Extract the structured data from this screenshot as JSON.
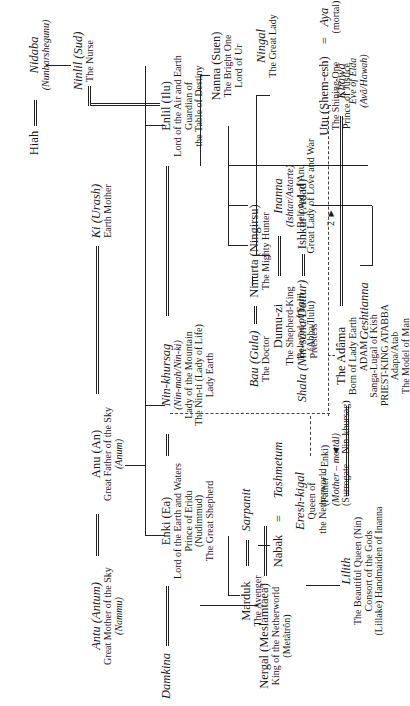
{
  "diagram": {
    "type": "genealogy-tree",
    "orientation": "rotated-90-ccw",
    "nodes": {
      "hiah": {
        "name": "Hiah"
      },
      "nidaba": {
        "name": "Nidaba",
        "alias": "(Nunbarshegunu)"
      },
      "ninlil": {
        "name": "Ninlil (Sud)",
        "title": "The Nurse"
      },
      "ki": {
        "name": "Ki (Urash)",
        "title": "Earth Mother"
      },
      "anu": {
        "name": "Anu (An)",
        "title": "Great Father of the Sky",
        "alias": "(Anum)"
      },
      "antu": {
        "name": "Antu (Antum)",
        "title": "Great Mother of the Sky",
        "alias": "(Nammu)"
      },
      "enlil": {
        "name": "Enlil (Ilu)",
        "title1": "Lord of the Air and Earth",
        "title2": "Guardian of",
        "title3": "the Table of Destiny"
      },
      "ninkhursag": {
        "name": "Nin-khursag",
        "alias": "(Nin-mah/Nin-ki)",
        "title1": "Lady of the Mountain",
        "title2": "The Nin-ti (Lady of Life)",
        "title3": "Lady Earth"
      },
      "enki": {
        "name": "Enki (Ea)",
        "title1": "Lord of the Earth and Waters",
        "title2": "Prince of Eridu",
        "alias": "(Nudimmud)",
        "title3": "The Great Shepherd"
      },
      "damkina": {
        "name": "Damkina"
      },
      "marduk": {
        "name": "Marduk",
        "title": "The Avenger"
      },
      "sarpanit": {
        "name": "Sarpanit"
      },
      "nabak": {
        "name": "Nabak"
      },
      "tashmetum": {
        "name": "Tashmetum"
      },
      "bau": {
        "name": "Bau (Gula)",
        "title": "The Doctor"
      },
      "ninurta": {
        "name": "Ninurta (Ningirsu)",
        "title": "The Mighty Hunter"
      },
      "shala": {
        "name": "Shala (Nin-sāna/Duttur)",
        "title": "Priestess"
      },
      "ishkur": {
        "name": "Ishkur (Adad)"
      },
      "geshtianna": {
        "name": "Geshtianna"
      },
      "nanna": {
        "name": "Nanna (Suen)",
        "title1": "The Bright One",
        "title2": "Lord of Ur"
      },
      "ningal": {
        "name": "Ningal",
        "title": "The Great Lady"
      },
      "utu": {
        "name": "Utu (Shem-esh)",
        "title1": "The Shining One",
        "title2": "Prince of Justice"
      },
      "aya": {
        "name": "Aya",
        "title": "(mortal)"
      },
      "inanna": {
        "name": "Inanna",
        "alias": "(Ishtar/Astarte)",
        "title1": "Beloved of Anu",
        "title2": "Great Lady of Love and War"
      },
      "dumuzi": {
        "name": "Dumu-zi",
        "title1": "The Shepherd-King",
        "title2": "Beloved of Enlil",
        "alias": "(Abba/Ilulu)"
      },
      "khawa": {
        "name": "Khâwâ",
        "title": "Eve of Elda",
        "alias": "(Avâ/Hawah)"
      },
      "adama": {
        "name": "The Adâma",
        "title1": "Born of Lady Earth",
        "title2": "ADAM",
        "title3": "Sanga-Lugal of Kish",
        "title4": "PRIEST-KING ATABBA",
        "title5": "Adapa/Atab",
        "title6": "The Model of Man"
      },
      "parentage": {
        "father": "(Father – Enki)",
        "mother": "(Mother – mortal)",
        "surrogate": "(Surrogate – Nin-khursag)"
      },
      "ereshkigal": {
        "name": "Eresh-kigal",
        "title1": "Queen of",
        "title2": "the Netherworld"
      },
      "nergal": {
        "name": "Nergal (Meslamtaea)",
        "title": "King of the Netherworld",
        "alias": "(Metâtrôn)"
      },
      "lilith": {
        "name": "Lilith",
        "title1": "The Beautiful Queen (Nin)",
        "title2": "Consort of the Gods",
        "title3": "(Lillake) Handmaiden of Inanna"
      }
    },
    "symbols": {
      "equals": "=",
      "marker1": "◄ 1",
      "marker2": "2 ►"
    },
    "colors": {
      "ink": "#222222",
      "background": "#ffffff"
    }
  }
}
